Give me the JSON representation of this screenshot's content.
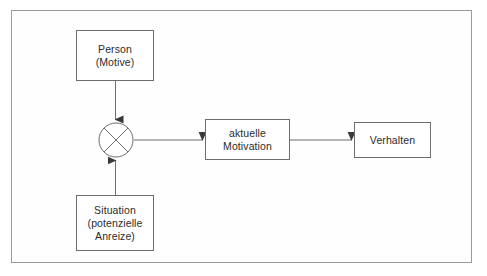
{
  "diagram": {
    "frame": {
      "border_color": "#9b9b9b",
      "background": "#ffffff"
    },
    "stroke_color": "#6e6e6e",
    "text_color": "#2b2b2b",
    "nodes": {
      "person": {
        "id": "person",
        "shape": "rectangle",
        "lines": [
          "Person",
          "(Motive)"
        ],
        "line1": "Person",
        "line2": "(Motive)"
      },
      "situation": {
        "id": "situation",
        "shape": "rectangle",
        "lines": [
          "Situation",
          "(potenzielle",
          "Anreize)"
        ],
        "line1": "Situation",
        "line2": "(potenzielle",
        "line3": "Anreize)"
      },
      "operator": {
        "id": "operator",
        "shape": "circle-with-cross",
        "symbol": "⊗",
        "meaning": "multiplication"
      },
      "motivation": {
        "id": "motivation",
        "shape": "rectangle",
        "lines": [
          "aktuelle",
          "Motivation"
        ],
        "line1": "aktuelle",
        "line2": "Motivation"
      },
      "verhalten": {
        "id": "verhalten",
        "shape": "rectangle",
        "lines": [
          "Verhalten"
        ],
        "line1": "Verhalten"
      }
    },
    "edges": [
      {
        "id": "person-to-operator",
        "from": "person",
        "to": "operator",
        "direction": "down",
        "label": ""
      },
      {
        "id": "situation-to-operator",
        "from": "situation",
        "to": "operator",
        "direction": "up",
        "label": ""
      },
      {
        "id": "operator-to-motivation",
        "from": "operator",
        "to": "motivation",
        "direction": "right",
        "label": ""
      },
      {
        "id": "motivation-to-verhalten",
        "from": "motivation",
        "to": "verhalten",
        "direction": "right",
        "label": ""
      }
    ]
  }
}
